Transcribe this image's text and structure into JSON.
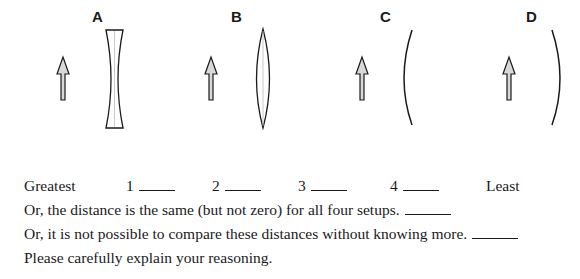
{
  "setups": [
    {
      "label": "A",
      "element": "diverging-lens"
    },
    {
      "label": "B",
      "element": "converging-lens"
    },
    {
      "label": "C",
      "element": "mirror-curved-left"
    },
    {
      "label": "D",
      "element": "mirror-curved-right"
    }
  ],
  "ranking": {
    "greatest_label": "Greatest",
    "least_label": "Least",
    "ranks": [
      "1",
      "2",
      "3",
      "4"
    ]
  },
  "options": {
    "same_distance": "Or, the distance is the same (but not zero) for all four setups.",
    "cannot_compare": "Or, it is not possible to compare these distances without knowing more."
  },
  "instruction": "Please carefully explain your reasoning.",
  "colors": {
    "stroke": "#1a1a1a",
    "arrow_fill": "#d8d8d8"
  }
}
